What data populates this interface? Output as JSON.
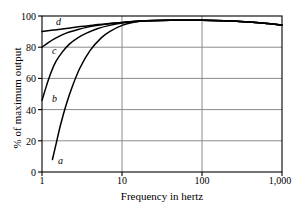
{
  "chart_data": {
    "type": "line",
    "title": "",
    "xlabel": "Frequency in hertz",
    "ylabel": "% of maximum output",
    "xscale": "log",
    "xlim": [
      1,
      1000
    ],
    "ylim": [
      0,
      100
    ],
    "grid": true,
    "legend_position": "inline-curve-labels",
    "xticks": [
      {
        "value": 1,
        "label": "1"
      },
      {
        "value": 10,
        "label": "10"
      },
      {
        "value": 100,
        "label": "100"
      },
      {
        "value": 1000,
        "label": "1,000"
      }
    ],
    "yticks": [
      {
        "value": 0,
        "label": "0"
      },
      {
        "value": 20,
        "label": "20"
      },
      {
        "value": 40,
        "label": "40"
      },
      {
        "value": 60,
        "label": "60"
      },
      {
        "value": 80,
        "label": "80"
      },
      {
        "value": 100,
        "label": "100"
      }
    ],
    "series": [
      {
        "name": "a",
        "label": "a",
        "color": "#000000",
        "points": [
          [
            1.35,
            8
          ],
          [
            1.5,
            18
          ],
          [
            1.7,
            30
          ],
          [
            2.0,
            43
          ],
          [
            2.4,
            55
          ],
          [
            3.0,
            67
          ],
          [
            4.0,
            78
          ],
          [
            5.5,
            86
          ],
          [
            7.0,
            90
          ],
          [
            10.0,
            94
          ],
          [
            14.0,
            96
          ],
          [
            20.0,
            97
          ],
          [
            40.0,
            97.3
          ],
          [
            100.0,
            97.2
          ],
          [
            300.0,
            96.5
          ],
          [
            600.0,
            95.3
          ],
          [
            1000.0,
            94.2
          ]
        ]
      },
      {
        "name": "b",
        "label": "b",
        "color": "#000000",
        "points": [
          [
            1.0,
            46
          ],
          [
            1.15,
            56
          ],
          [
            1.3,
            64
          ],
          [
            1.5,
            71
          ],
          [
            1.8,
            77
          ],
          [
            2.2,
            82
          ],
          [
            2.8,
            86
          ],
          [
            3.6,
            89
          ],
          [
            5.0,
            92
          ],
          [
            7.0,
            94
          ],
          [
            10.0,
            95.5
          ],
          [
            15.0,
            96.5
          ],
          [
            20.0,
            97
          ],
          [
            40.0,
            97.3
          ],
          [
            100.0,
            97.2
          ],
          [
            300.0,
            96.5
          ],
          [
            600.0,
            95.3
          ],
          [
            1000.0,
            94.2
          ]
        ]
      },
      {
        "name": "c",
        "label": "c",
        "color": "#000000",
        "points": [
          [
            1.0,
            80
          ],
          [
            1.2,
            83
          ],
          [
            1.5,
            86
          ],
          [
            2.0,
            89
          ],
          [
            2.7,
            91
          ],
          [
            3.6,
            92.7
          ],
          [
            5.0,
            94
          ],
          [
            7.0,
            95
          ],
          [
            10.0,
            95.8
          ],
          [
            15.0,
            96.6
          ],
          [
            20.0,
            97
          ],
          [
            40.0,
            97.3
          ],
          [
            100.0,
            97.2
          ],
          [
            300.0,
            96.5
          ],
          [
            600.0,
            95.3
          ],
          [
            1000.0,
            94.2
          ]
        ]
      },
      {
        "name": "d",
        "label": "d",
        "color": "#000000",
        "points": [
          [
            1.0,
            90
          ],
          [
            1.4,
            91
          ],
          [
            2.0,
            92
          ],
          [
            3.0,
            93.2
          ],
          [
            4.5,
            94.2
          ],
          [
            6.5,
            95.1
          ],
          [
            10.0,
            95.9
          ],
          [
            15.0,
            96.6
          ],
          [
            20.0,
            97
          ],
          [
            40.0,
            97.3
          ],
          [
            100.0,
            97.2
          ],
          [
            300.0,
            96.5
          ],
          [
            600.0,
            95.3
          ],
          [
            1000.0,
            94.2
          ]
        ]
      }
    ],
    "curve_labels": [
      {
        "name": "d",
        "text": "d"
      },
      {
        "name": "c",
        "text": "c"
      },
      {
        "name": "b",
        "text": "b"
      },
      {
        "name": "a",
        "text": "a"
      }
    ],
    "colors": {
      "axis": "#000000",
      "grid": "#8a8a8a",
      "curve": "#000000",
      "background": "#ffffff"
    }
  }
}
